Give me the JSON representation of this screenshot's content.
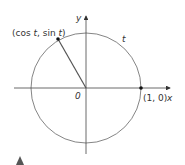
{
  "diagram": {
    "axis_x_label": "x",
    "axis_y_label": "y",
    "origin_label": "0",
    "point_on_circle_label_parts": [
      "(cos ",
      "t",
      ", sin ",
      "t",
      ")"
    ],
    "point_1_0_label": "(1, 0)",
    "arc_label": "t",
    "colors": {
      "line": "#555555",
      "axis": "#444444",
      "point": "#111111",
      "marker": "#555555"
    }
  }
}
